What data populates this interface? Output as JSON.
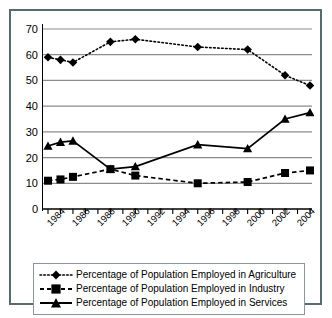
{
  "chart_data": {
    "type": "line",
    "title": "",
    "subtitle": "",
    "xlabel": "",
    "ylabel": "",
    "ylim": [
      0,
      70
    ],
    "ytick_step": 10,
    "yticks": [
      0,
      10,
      20,
      30,
      40,
      50,
      60,
      70
    ],
    "ytick_labels": [
      "0",
      "10",
      "20",
      "30",
      "40",
      "50",
      "60",
      "70"
    ],
    "xlim": [
      1984,
      2005
    ],
    "xticks": [
      1984,
      1985,
      1986,
      1987,
      1988,
      1989,
      1990,
      1991,
      1992,
      1993,
      1994,
      1995,
      1996,
      1997,
      1998,
      1999,
      2000,
      2001,
      2002,
      2003,
      2004,
      2005
    ],
    "xtick_labels": [
      "1984",
      "1986",
      "1988",
      "1990",
      "1992",
      "1994",
      "1996",
      "1998",
      "2000",
      "2002",
      "2004"
    ],
    "xtick_label_years": [
      1984,
      1986,
      1988,
      1990,
      1992,
      1994,
      1996,
      1998,
      2000,
      2002,
      2004
    ],
    "grid": true,
    "grid_axis": "y",
    "grid_color": "#8c8c8c",
    "legend_position": "below",
    "x": [
      1984,
      1985,
      1986,
      1989,
      1991,
      1996,
      2000,
      2003,
      2005
    ],
    "series": [
      {
        "name": "Percentage of Population Employed in Agriculture",
        "marker": "diamond",
        "linestyle": "dotted",
        "color": "#000000",
        "values": [
          59,
          58,
          57,
          65,
          66,
          63,
          62,
          52,
          48
        ]
      },
      {
        "name": "Percentage of Population Employed in Industry",
        "marker": "square",
        "linestyle": "dashed",
        "color": "#000000",
        "values": [
          11,
          11.5,
          12.5,
          15.5,
          13,
          10,
          10.5,
          14,
          15
        ]
      },
      {
        "name": "Percentage of Population Employed in Services",
        "marker": "triangle",
        "linestyle": "solid",
        "color": "#000000",
        "values": [
          24.5,
          26,
          26.5,
          15.5,
          16.5,
          25,
          23.5,
          35,
          37.5
        ]
      }
    ]
  },
  "legend": {
    "items": [
      {
        "label": "Percentage of Population Employed in Agriculture",
        "marker": "diamond-marker-icon",
        "linestyle": "dotted"
      },
      {
        "label": "Percentage of Population Employed in Industry",
        "marker": "square-marker-icon",
        "linestyle": "dashed"
      },
      {
        "label": "Percentage of Population Employed in Services",
        "marker": "triangle-marker-icon",
        "linestyle": "solid"
      }
    ]
  },
  "style": {
    "frame_color": "#5a6a72",
    "axis_color": "#000000",
    "grid_color": "#8c8c8c",
    "legend_border_color": "#8a969c",
    "background": "#ffffff"
  }
}
